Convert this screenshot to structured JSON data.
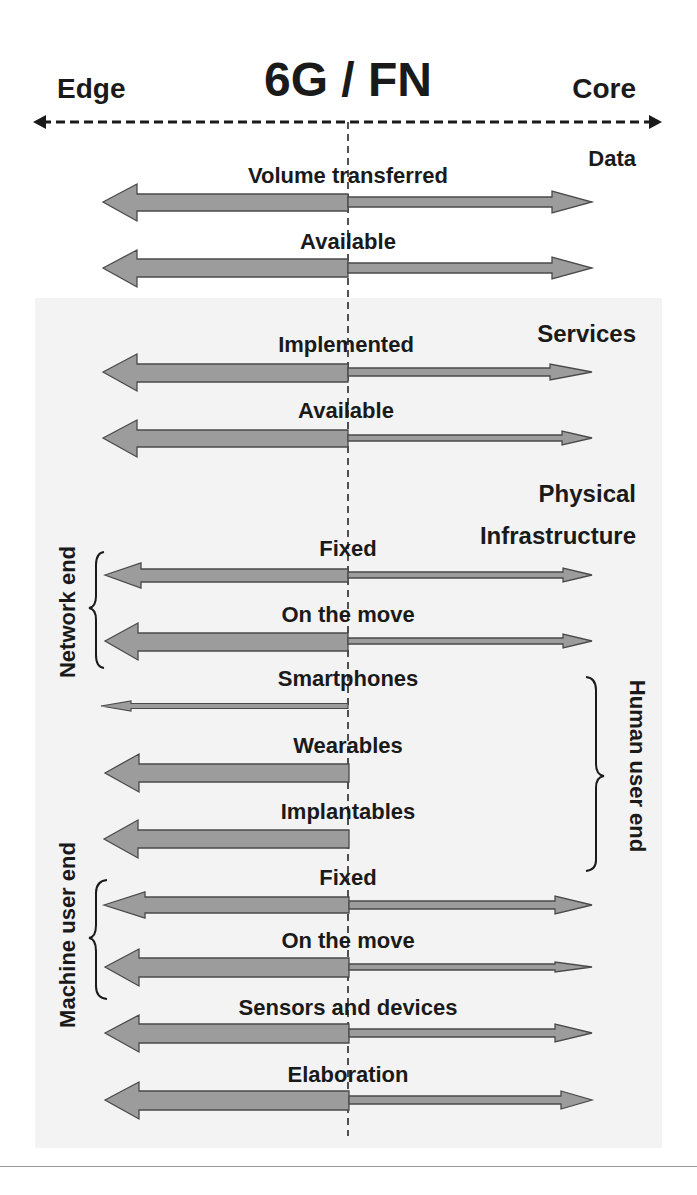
{
  "title": "6G / FN",
  "axis": {
    "left_label": "Edge",
    "right_label": "Core",
    "style": "dashed double-headed arrow"
  },
  "colors": {
    "arrow_fill": "#9c9c9c",
    "arrow_stroke": "#4a4a4a",
    "panel_background": "#f3f3f3",
    "text": "#1a1a1a",
    "divider": "#9a9a9a"
  },
  "sections": [
    {
      "name": "Data",
      "label": "Data",
      "rows": [
        {
          "label": "Volume transferred",
          "edge_weight": "thick",
          "core_weight": "medium"
        },
        {
          "label": "Available",
          "edge_weight": "thick",
          "core_weight": "medium"
        }
      ]
    },
    {
      "name": "Services",
      "label": "Services",
      "rows": [
        {
          "label": "Implemented",
          "edge_weight": "thick",
          "core_weight": "medium"
        },
        {
          "label": "Available",
          "edge_weight": "thick",
          "core_weight": "thin"
        }
      ]
    },
    {
      "name": "Physical Infrastructure",
      "label_line1": "Physical",
      "label_line2": "Infrastructure",
      "groups": [
        {
          "label": "Network end",
          "side": "left",
          "rows": [
            {
              "label": "Fixed",
              "edge_weight": "medium",
              "core_weight": "thin"
            },
            {
              "label": "On the move",
              "edge_weight": "thick",
              "core_weight": "thin"
            }
          ]
        },
        {
          "label": "Human user end",
          "side": "right",
          "rows": [
            {
              "label": "Smartphones",
              "edge_weight": "very thin",
              "core_weight": "none"
            },
            {
              "label": "Wearables",
              "edge_weight": "thick",
              "core_weight": "none"
            },
            {
              "label": "Implantables",
              "edge_weight": "thick",
              "core_weight": "none"
            }
          ]
        },
        {
          "label": "Machine user end",
          "side": "left",
          "rows": [
            {
              "label": "Fixed",
              "edge_weight": "thick",
              "core_weight": "medium"
            },
            {
              "label": "On the move",
              "edge_weight": "thick",
              "core_weight": "thin"
            },
            {
              "label": "Sensors and devices",
              "edge_weight": "thick",
              "core_weight": "medium"
            }
          ]
        }
      ]
    },
    {
      "name": "Elaboration",
      "rows": [
        {
          "label": "Elaboration",
          "edge_weight": "thick",
          "core_weight": "medium"
        }
      ]
    }
  ]
}
